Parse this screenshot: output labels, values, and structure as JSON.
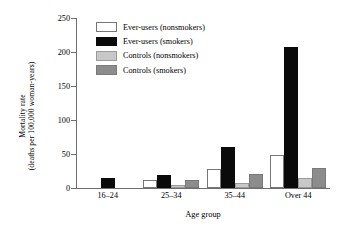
{
  "chart_data": {
    "type": "bar",
    "title": "",
    "xlabel": "Age group",
    "ylabel": "Mortality rate (deaths per 100,000 woman-years)",
    "ylabel_lines": [
      "Mortality rate",
      "(deaths per 100,000 woman-years)"
    ],
    "categories": [
      "16–24",
      "25–34",
      "35–44",
      "Over 44"
    ],
    "yticks": [
      0,
      50,
      100,
      150,
      200,
      250
    ],
    "ytick_labels": [
      "0",
      "50",
      "100",
      "150",
      "200",
      "250"
    ],
    "ylim": [
      0,
      250
    ],
    "grid": false,
    "legend_position": "upper-left-inside",
    "series": [
      {
        "name": "Ever-users (nonsmokers)",
        "color": "#ffffff",
        "edge": "#777777",
        "style": "white",
        "values": [
          0,
          12,
          28,
          48
        ]
      },
      {
        "name": "Ever-users (smokers)",
        "color": "#0a0a0a",
        "edge": "#0a0a0a",
        "style": "black",
        "values": [
          14,
          19,
          61,
          207
        ]
      },
      {
        "name": "Controls (nonsmokers)",
        "color": "#c8c8c8",
        "edge": "#9a9a9a",
        "style": "lgray",
        "values": [
          0,
          5,
          7,
          14
        ]
      },
      {
        "name": "Controls (smokers)",
        "color": "#8c8c8c",
        "edge": "#7a7a7a",
        "style": "dgray",
        "values": [
          0,
          12,
          20,
          30
        ]
      }
    ]
  }
}
